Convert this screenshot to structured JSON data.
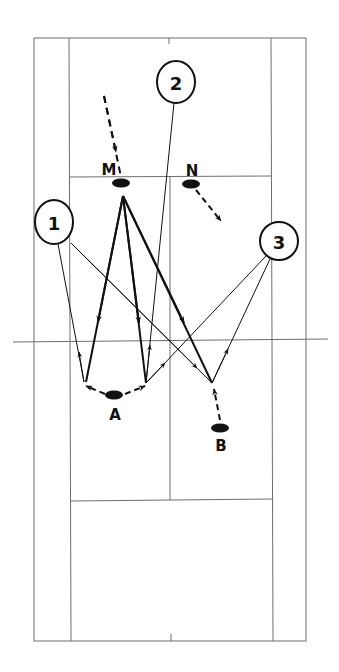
{
  "diagram": {
    "type": "badminton-court-drill",
    "colors": {
      "line": "#6e6e6e",
      "ink": "#111111",
      "background": "#ffffff"
    },
    "court": {
      "outer": {
        "x1": 34,
        "y1": 38,
        "x2": 306,
        "y2": 641
      },
      "singles_left_x": 69,
      "singles_right_x": 272,
      "center_x": 170,
      "net_y": 341,
      "net_x1": 13,
      "net_x2": 328,
      "short_service_top_y": 177,
      "short_service_bottom_y": 500
    },
    "players": [
      {
        "id": "M",
        "label": "M",
        "x": 121,
        "y": 183,
        "label_x": 109,
        "label_y": 175
      },
      {
        "id": "N",
        "label": "N",
        "x": 191,
        "y": 184,
        "label_x": 192,
        "label_y": 176
      },
      {
        "id": "A",
        "label": "A",
        "x": 114,
        "y": 395,
        "label_x": 115,
        "label_y": 419
      },
      {
        "id": "B",
        "label": "B",
        "x": 220,
        "y": 428,
        "label_x": 221,
        "label_y": 450
      }
    ],
    "targets": [
      {
        "id": "1",
        "label": "1",
        "cx": 54,
        "cy": 222,
        "rx": 19,
        "ry": 22
      },
      {
        "id": "2",
        "label": "2",
        "cx": 176,
        "cy": 82,
        "rx": 19,
        "ry": 21
      },
      {
        "id": "3",
        "label": "3",
        "cx": 279,
        "cy": 241,
        "rx": 19,
        "ry": 19
      }
    ]
  }
}
